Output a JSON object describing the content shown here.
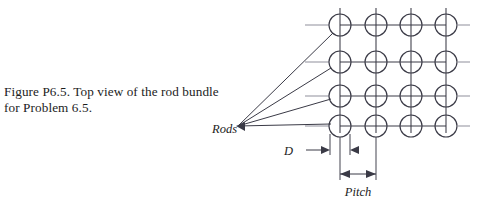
{
  "caption": {
    "line1": "Figure P6.5. Top view of the rod bundle",
    "line2": "for Problem 6.5."
  },
  "figure": {
    "labels": {
      "rods": "Rods",
      "diameter": "D",
      "pitch": "Pitch"
    }
  },
  "diagram_data": {
    "type": "technical-diagram",
    "description": "Top view of a square-pitch rod bundle array",
    "grid": {
      "rows": 4,
      "columns": 4,
      "column_centers_px": [
        340,
        376,
        411,
        446
      ],
      "row_centers_px": [
        25,
        62,
        96,
        126
      ],
      "rod_radius_px": 11
    },
    "annotations": [
      {
        "name": "Rods",
        "type": "leader-label",
        "anchor_px": [
          237,
          126
        ],
        "targets": 4
      },
      {
        "name": "D",
        "type": "dimension",
        "meaning": "rod diameter",
        "span": "gap between adjacent rod extension lines"
      },
      {
        "name": "Pitch",
        "type": "dimension",
        "meaning": "center-to-center rod spacing",
        "span": "between adjacent rod centers"
      }
    ],
    "colors": {
      "line": "#3a3a46",
      "stub": "#8c8c96",
      "text": "#1c1c1c",
      "background": "#ffffff"
    }
  }
}
